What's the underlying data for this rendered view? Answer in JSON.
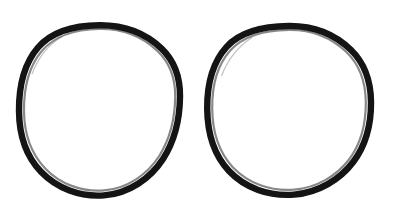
{
  "image": {
    "subject": "two black rubber o-ring gaskets",
    "background_color": "#ffffff",
    "width": 397,
    "height": 216,
    "object_count": 2,
    "alt_text": "Two black rubber O-ring seals shown side by side on a plain white background"
  },
  "objects": [
    {
      "name": "o-ring-left",
      "label": "Left O-ring",
      "shape": "ring",
      "color": "#141414",
      "center_x": 99,
      "center_y": 110,
      "outer_radius_x": 80,
      "outer_radius_y": 85,
      "stroke_width": 6
    },
    {
      "name": "o-ring-right",
      "label": "Right O-ring",
      "shape": "ring",
      "color": "#141414",
      "center_x": 290,
      "center_y": 111,
      "outer_radius_x": 81,
      "outer_radius_y": 85,
      "stroke_width": 6
    }
  ]
}
